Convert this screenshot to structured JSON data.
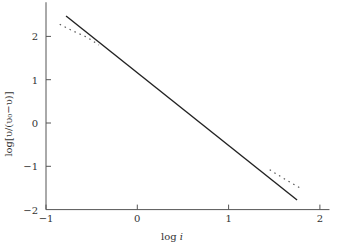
{
  "chart_data": {
    "type": "line",
    "title": "",
    "xlabel": "log i",
    "ylabel": "log[υ/(υ0−υ)]",
    "xlim": [
      -1,
      2.05
    ],
    "ylim": [
      -2,
      2.65
    ],
    "xticks": [
      -1,
      0,
      1,
      2
    ],
    "yticks": [
      -2,
      -1,
      0,
      1,
      2
    ],
    "xtick_labels": [
      "−1",
      "0",
      "1",
      "2"
    ],
    "ytick_labels": [
      "−2",
      "−1",
      "0",
      "1",
      "2"
    ],
    "grid": false,
    "legend": null,
    "series": [
      {
        "name": "fitted line",
        "style": "solid",
        "x": [
          -0.78,
          1.75
        ],
        "y": [
          2.47,
          -1.78
        ]
      },
      {
        "name": "data (upper)",
        "style": "dotted",
        "x": [
          -0.85,
          -0.7,
          -0.55,
          -0.42
        ],
        "y": [
          2.28,
          2.12,
          1.98,
          1.8
        ]
      },
      {
        "name": "data (lower)",
        "style": "dotted",
        "x": [
          1.45,
          1.58,
          1.7,
          1.8
        ],
        "y": [
          -1.08,
          -1.25,
          -1.4,
          -1.52
        ]
      }
    ]
  },
  "axes": {
    "xlabel_main": "log ",
    "xlabel_var": "i",
    "ylabel_text": "log[υ/(υ₀−υ)]"
  },
  "colors": {
    "line": "#222222",
    "axis": "#555555"
  }
}
